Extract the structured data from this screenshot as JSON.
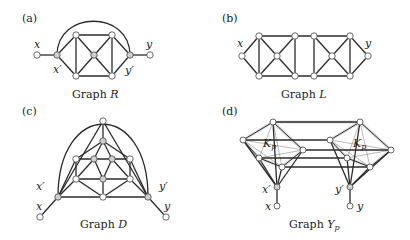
{
  "panels": [
    {
      "id": "a",
      "tag": "(a)",
      "caption_prefix": "Graph ",
      "caption_var": "R",
      "labels": {
        "x": "x",
        "xp": "x′",
        "y": "y",
        "yp": "y′"
      }
    },
    {
      "id": "b",
      "tag": "(b)",
      "caption_prefix": "Graph ",
      "caption_var": "L",
      "labels": {
        "x": "x",
        "y": "y"
      }
    },
    {
      "id": "c",
      "tag": "(c)",
      "caption_prefix": "Graph ",
      "caption_var": "D",
      "labels": {
        "x": "x",
        "xp": "x′",
        "y": "y",
        "yp": "y′"
      }
    },
    {
      "id": "d",
      "tag": "(d)",
      "caption_prefix": "Graph ",
      "caption_var": "Y",
      "caption_sub": "p",
      "labels": {
        "x": "x",
        "xp": "x′",
        "y": "y",
        "yp": "y′",
        "k_left": "K",
        "k_right": "K",
        "k_sub": "p"
      }
    }
  ]
}
